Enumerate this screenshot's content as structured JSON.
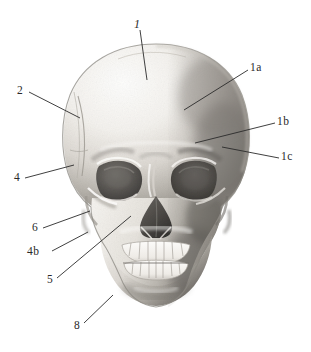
{
  "figure": {
    "kind": "anatomical-illustration",
    "medium": "graphite pencil shading",
    "background_color": "#ffffff",
    "ink_color": "#2a2a2a",
    "bone_light": "#f2f0ec",
    "bone_mid": "#c9c6c0",
    "bone_shadow": "#8d8a85",
    "bone_dark": "#5d5b57",
    "cavity_dark": "#4a4846"
  },
  "labels": [
    {
      "id": "1",
      "text": "1",
      "x": 134,
      "y": 18,
      "leader": {
        "x1": 140,
        "y1": 30,
        "x2": 147,
        "y2": 80
      }
    },
    {
      "id": "1a",
      "text": "1a",
      "x": 250,
      "y": 62,
      "leader": {
        "x1": 248,
        "y1": 70,
        "x2": 184,
        "y2": 110
      }
    },
    {
      "id": "1b",
      "text": "1b",
      "x": 277,
      "y": 116,
      "leader": {
        "x1": 275,
        "y1": 123,
        "x2": 195,
        "y2": 143
      }
    },
    {
      "id": "1c",
      "text": "1c",
      "x": 281,
      "y": 151,
      "leader": {
        "x1": 279,
        "y1": 158,
        "x2": 222,
        "y2": 147
      }
    },
    {
      "id": "2",
      "text": "2",
      "x": 17,
      "y": 85,
      "leader": {
        "x1": 29,
        "y1": 92,
        "x2": 80,
        "y2": 118
      }
    },
    {
      "id": "4",
      "text": "4",
      "x": 14,
      "y": 172,
      "leader": {
        "x1": 25,
        "y1": 178,
        "x2": 74,
        "y2": 165
      }
    },
    {
      "id": "6",
      "text": "6",
      "x": 32,
      "y": 222,
      "leader": {
        "x1": 43,
        "y1": 228,
        "x2": 90,
        "y2": 211
      }
    },
    {
      "id": "4b",
      "text": "4b",
      "x": 27,
      "y": 246,
      "leader": {
        "x1": 52,
        "y1": 251,
        "x2": 88,
        "y2": 232
      }
    },
    {
      "id": "5",
      "text": "5",
      "x": 47,
      "y": 274,
      "leader": {
        "x1": 57,
        "y1": 278,
        "x2": 131,
        "y2": 216
      }
    },
    {
      "id": "8",
      "text": "8",
      "x": 74,
      "y": 320,
      "leader": {
        "x1": 84,
        "y1": 323,
        "x2": 113,
        "y2": 295
      }
    }
  ]
}
